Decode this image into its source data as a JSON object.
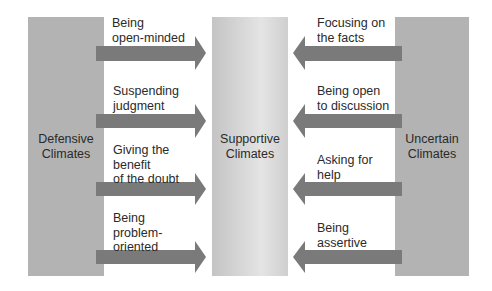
{
  "diagram": {
    "panels": {
      "left": {
        "label": "Defensive\nClimates"
      },
      "middle": {
        "label": "Supportive\nClimates"
      },
      "right": {
        "label": "Uncertain\nClimates"
      }
    },
    "left_arrows": [
      {
        "label": "Being\nopen-minded",
        "direction": "right"
      },
      {
        "label": "Suspending\njudgment",
        "direction": "right"
      },
      {
        "label": "Giving the\nbenefit\nof the doubt",
        "direction": "right"
      },
      {
        "label": "Being\nproblem-\noriented",
        "direction": "right"
      }
    ],
    "right_arrows": [
      {
        "label": "Focusing on\nthe facts",
        "direction": "left"
      },
      {
        "label": "Being open\nto discussion",
        "direction": "left"
      },
      {
        "label": "Asking for\nhelp",
        "direction": "left"
      },
      {
        "label": "Being\nassertive",
        "direction": "left"
      }
    ],
    "colors": {
      "panel": "#b3b3b3",
      "arrow": "#7a7a7a",
      "text": "#2a2a2a"
    }
  }
}
